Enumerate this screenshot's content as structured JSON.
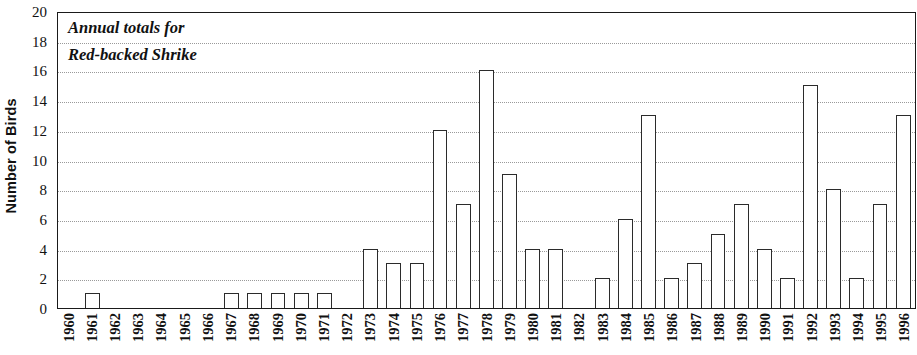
{
  "chart_data": {
    "type": "bar",
    "title": "Annual totals for Red-backed Shrike",
    "title_lines": [
      "Annual totals for",
      "Red-backed Shrike"
    ],
    "xlabel": "",
    "ylabel": "Number of Birds",
    "ylim": [
      0,
      20
    ],
    "ytick_step": 2,
    "yticks": [
      20,
      18,
      16,
      14,
      12,
      10,
      8,
      6,
      4,
      2,
      0
    ],
    "grid": true,
    "grid_axis": "y",
    "legend": null,
    "bar_face_color": "#ffffff",
    "bar_edge_color": "#2b2b2b",
    "categories": [
      "1960",
      "1961",
      "1962",
      "1963",
      "1964",
      "1965",
      "1966",
      "1967",
      "1968",
      "1969",
      "1970",
      "1971",
      "1972",
      "1973",
      "1974",
      "1975",
      "1976",
      "1977",
      "1978",
      "1979",
      "1980",
      "1981",
      "1982",
      "1983",
      "1984",
      "1985",
      "1986",
      "1987",
      "1988",
      "1989",
      "1990",
      "1991",
      "1992",
      "1993",
      "1994",
      "1995",
      "1996"
    ],
    "values": [
      0,
      1,
      0,
      0,
      0,
      0,
      0,
      1,
      1,
      1,
      1,
      1,
      0,
      4,
      3,
      3,
      12,
      7,
      16,
      9,
      4,
      4,
      0,
      2,
      6,
      13,
      2,
      3,
      5,
      7,
      4,
      2,
      15,
      8,
      2,
      7,
      13
    ]
  }
}
